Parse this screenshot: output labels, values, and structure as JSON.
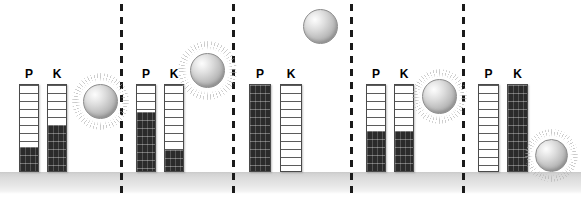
{
  "diagram": {
    "potential_label": "P",
    "kinetic_label": "K",
    "ball_icon": "sphere-icon",
    "colors": {
      "fill": "#2b2b2b",
      "tube_outline": "#4a4a4a",
      "ground": "#d3d3d3",
      "divider": "#1a1a1a",
      "ball": "#c2c2c2",
      "background": "#ffffff"
    },
    "ground": {
      "label": "ground-surface",
      "top": 172,
      "height": 22
    },
    "dividers": [
      {
        "name": "divider-1",
        "x": 120
      },
      {
        "name": "divider-2",
        "x": 232
      },
      {
        "name": "divider-3",
        "x": 350
      },
      {
        "name": "divider-4",
        "x": 462
      }
    ],
    "panels": [
      {
        "name": "stage-1",
        "left": 0,
        "gauges": [
          {
            "label": "P",
            "name": "gauge-potential",
            "x": 19,
            "y": 84,
            "w": 20,
            "h": 88,
            "fill_percent": 28
          },
          {
            "label": "K",
            "name": "gauge-kinetic",
            "x": 47,
            "y": 84,
            "w": 20,
            "h": 88,
            "fill_percent": 54
          }
        ],
        "ball": {
          "x": 83,
          "y": 84,
          "size": 35,
          "burst": true,
          "burst_scale": 1.62
        }
      },
      {
        "name": "stage-2",
        "left": 0,
        "gauges": [
          {
            "label": "P",
            "name": "gauge-potential",
            "x": 136,
            "y": 84,
            "w": 20,
            "h": 88,
            "fill_percent": 69
          },
          {
            "label": "K",
            "name": "gauge-kinetic",
            "x": 164,
            "y": 84,
            "w": 20,
            "h": 88,
            "fill_percent": 25
          }
        ],
        "ball": {
          "x": 190,
          "y": 53,
          "size": 35,
          "burst": true,
          "burst_scale": 1.66
        }
      },
      {
        "name": "stage-3",
        "left": 0,
        "gauges": [
          {
            "label": "P",
            "name": "gauge-potential",
            "x": 249,
            "y": 84,
            "w": 22,
            "h": 88,
            "fill_percent": 100
          },
          {
            "label": "K",
            "name": "gauge-kinetic",
            "x": 280,
            "y": 84,
            "w": 22,
            "h": 88,
            "fill_percent": 0
          }
        ],
        "ball": {
          "x": 303,
          "y": 9,
          "size": 35,
          "burst": false,
          "burst_scale": 1.0
        }
      },
      {
        "name": "stage-4",
        "left": 0,
        "gauges": [
          {
            "label": "P",
            "name": "gauge-potential",
            "x": 366,
            "y": 84,
            "w": 20,
            "h": 88,
            "fill_percent": 46
          },
          {
            "label": "K",
            "name": "gauge-kinetic",
            "x": 394,
            "y": 84,
            "w": 20,
            "h": 88,
            "fill_percent": 46
          }
        ],
        "ball": {
          "x": 422,
          "y": 79,
          "size": 35,
          "burst": true,
          "burst_scale": 1.58
        }
      },
      {
        "name": "stage-5",
        "left": 0,
        "gauges": [
          {
            "label": "P",
            "name": "gauge-potential",
            "x": 478,
            "y": 84,
            "w": 21,
            "h": 88,
            "fill_percent": 0
          },
          {
            "label": "K",
            "name": "gauge-kinetic",
            "x": 507,
            "y": 84,
            "w": 21,
            "h": 88,
            "fill_percent": 100
          }
        ],
        "ball": {
          "x": 535,
          "y": 139,
          "size": 33,
          "burst": true,
          "burst_scale": 1.6
        }
      }
    ]
  }
}
